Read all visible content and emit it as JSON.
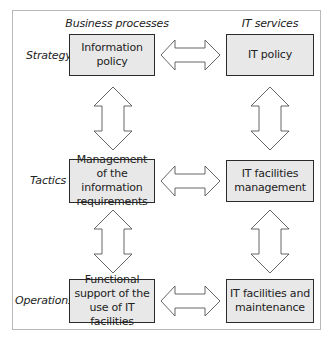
{
  "columns": {
    "left": "Business processes",
    "right": "IT services"
  },
  "rows": [
    {
      "label": "Strategy",
      "business": "Information policy",
      "it": "IT policy"
    },
    {
      "label": "Tactics",
      "business": "Management of the information requirements",
      "it": "IT facilities management"
    },
    {
      "label": "Operations",
      "business": "Functional support of the use of IT facilities",
      "it": "IT facilities and maintenance"
    }
  ],
  "arrows": {
    "horizontal": [
      "strategy-bidirectional",
      "tactics-bidirectional",
      "operations-bidirectional"
    ],
    "vertical": [
      "business-strategy-tactics",
      "business-tactics-operations",
      "it-strategy-tactics",
      "it-tactics-operations"
    ],
    "style": "double-headed-outline"
  },
  "colors": {
    "box_fill": "#e8e8e8",
    "box_border": "#2a2a2a",
    "frame_border": "#b8b8b8",
    "arrow_stroke": "#555555"
  }
}
